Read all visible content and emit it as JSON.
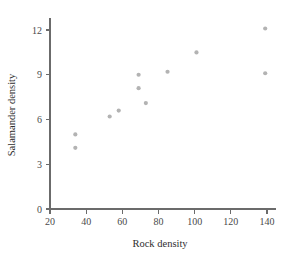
{
  "chart_data": {
    "type": "scatter",
    "title": "",
    "xlabel": "Rock density",
    "ylabel": "Salamander density",
    "xlim": [
      20,
      145
    ],
    "ylim": [
      0,
      12.8
    ],
    "xticks": [
      20,
      40,
      60,
      80,
      100,
      120,
      140
    ],
    "xtick_labels": [
      "20",
      "40",
      "60",
      "80",
      "100",
      "120",
      "140"
    ],
    "yticks": [
      0,
      3,
      6,
      9,
      12
    ],
    "ytick_labels": [
      "0",
      "3",
      "6",
      "9",
      "12"
    ],
    "grid": false,
    "legend": false,
    "point_color": "#b3b3b3",
    "axis_color": "#6b6b6b",
    "points": [
      {
        "x": 34,
        "y": 5.0
      },
      {
        "x": 34,
        "y": 4.1
      },
      {
        "x": 53,
        "y": 6.2
      },
      {
        "x": 58,
        "y": 6.6
      },
      {
        "x": 69,
        "y": 9.0
      },
      {
        "x": 69,
        "y": 8.1
      },
      {
        "x": 73,
        "y": 7.1
      },
      {
        "x": 85,
        "y": 9.2
      },
      {
        "x": 101,
        "y": 10.5
      },
      {
        "x": 139,
        "y": 12.1
      },
      {
        "x": 139,
        "y": 9.1
      }
    ],
    "series": [
      {
        "name": "observations",
        "x": [
          34,
          34,
          53,
          58,
          69,
          69,
          73,
          85,
          101,
          139,
          139
        ],
        "values": [
          5.0,
          4.1,
          6.2,
          6.6,
          9.0,
          8.1,
          7.1,
          9.2,
          10.5,
          12.1,
          9.1
        ]
      }
    ]
  }
}
